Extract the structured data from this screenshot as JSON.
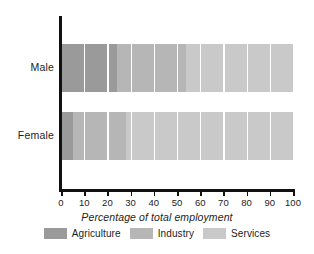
{
  "chart_data": {
    "type": "bar",
    "orientation": "horizontal",
    "stacked": true,
    "stack_total": 100,
    "title": "",
    "subtitle": "",
    "xlabel": "Percentage of total employment",
    "ylabel": "",
    "categories": [
      "Male",
      "Female"
    ],
    "series": [
      {
        "name": "Agriculture",
        "color": "#9a9a9a",
        "values": [
          24,
          5
        ]
      },
      {
        "name": "Industry",
        "color": "#b6b6b6",
        "values": [
          30,
          23
        ]
      },
      {
        "name": "Services",
        "color": "#c9c9c9",
        "values": [
          46,
          72
        ]
      }
    ],
    "xlim": [
      0,
      100
    ],
    "xticks": [
      0,
      10,
      20,
      30,
      40,
      50,
      60,
      70,
      80,
      90,
      100
    ],
    "xtick_labels": [
      "0",
      "10",
      "20",
      "30",
      "40",
      "50",
      "60",
      "70",
      "80",
      "90",
      "100"
    ],
    "grid": "vertical",
    "gridline_color": "#ffffff",
    "legend_position": "bottom",
    "axis_color": "#111111",
    "background": "#ffffff"
  },
  "legend": {
    "items": [
      {
        "label": "Agriculture",
        "color": "#9a9a9a"
      },
      {
        "label": "Industry",
        "color": "#b6b6b6"
      },
      {
        "label": "Services",
        "color": "#c9c9c9"
      }
    ]
  },
  "axis": {
    "x_title": "Percentage of total employment",
    "tick_labels": [
      "0",
      "10",
      "20",
      "30",
      "40",
      "50",
      "60",
      "70",
      "80",
      "90",
      "100"
    ],
    "category_labels": [
      "Male",
      "Female"
    ]
  }
}
